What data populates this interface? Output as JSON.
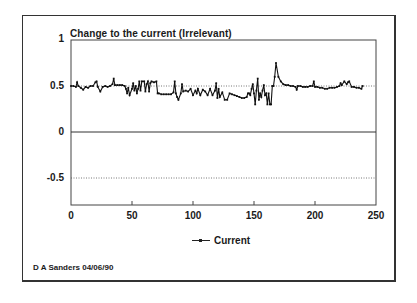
{
  "chart_data": {
    "type": "line",
    "title": "Change to the current (Irrelevant)",
    "xlabel": "",
    "ylabel": "",
    "xlim": [
      0,
      250
    ],
    "ylim": [
      -0.8,
      1
    ],
    "x_ticks": [
      "0",
      "50",
      "100",
      "150",
      "200",
      "250"
    ],
    "y_ticks": [
      "1",
      "0.5",
      "0",
      "-0.5"
    ],
    "reference_lines": [
      {
        "y": 0.5,
        "style": "dotted"
      },
      {
        "y": 0,
        "style": "solid"
      },
      {
        "y": -0.5,
        "style": "dotted"
      }
    ],
    "legend": {
      "position": "bottom",
      "entries": [
        "Current"
      ]
    },
    "grid": false,
    "series": [
      {
        "name": "Current",
        "marker": "small-square",
        "x": [
          0,
          2,
          4,
          5,
          6,
          8,
          10,
          12,
          14,
          16,
          18,
          20,
          21,
          22,
          24,
          26,
          28,
          30,
          32,
          34,
          35,
          36,
          38,
          40,
          42,
          44,
          45,
          46,
          47,
          48,
          50,
          51,
          52,
          53,
          54,
          55,
          56,
          57,
          58,
          60,
          61,
          62,
          63,
          64,
          65,
          66,
          68,
          70,
          71,
          72,
          74,
          76,
          78,
          80,
          82,
          84,
          85,
          86,
          87,
          88,
          90,
          91,
          92,
          94,
          96,
          98,
          100,
          102,
          103,
          104,
          106,
          108,
          110,
          112,
          114,
          116,
          118,
          119,
          120,
          121,
          122,
          124,
          126,
          128,
          130,
          132,
          134,
          136,
          138,
          140,
          142,
          144,
          145,
          146,
          147,
          148,
          149,
          150,
          151,
          152,
          153,
          154,
          155,
          156,
          157,
          158,
          159,
          160,
          161,
          162,
          163,
          164,
          165,
          166,
          167,
          168,
          170,
          172,
          174,
          176,
          178,
          180,
          182,
          184,
          185,
          186,
          188,
          190,
          192,
          194,
          196,
          198,
          199,
          200,
          202,
          204,
          206,
          208,
          210,
          212,
          214,
          216,
          218,
          220,
          221,
          222,
          224,
          226,
          227,
          228,
          230,
          232,
          234,
          236,
          238,
          239
        ],
        "values": [
          0.5,
          0.5,
          0.49,
          0.54,
          0.5,
          0.48,
          0.46,
          0.49,
          0.48,
          0.5,
          0.5,
          0.54,
          0.55,
          0.49,
          0.44,
          0.49,
          0.5,
          0.49,
          0.5,
          0.52,
          0.58,
          0.51,
          0.51,
          0.51,
          0.51,
          0.5,
          0.47,
          0.42,
          0.48,
          0.4,
          0.47,
          0.53,
          0.45,
          0.5,
          0.42,
          0.47,
          0.55,
          0.45,
          0.55,
          0.55,
          0.44,
          0.52,
          0.55,
          0.44,
          0.53,
          0.55,
          0.54,
          0.55,
          0.42,
          0.42,
          0.41,
          0.41,
          0.41,
          0.41,
          0.41,
          0.43,
          0.55,
          0.42,
          0.38,
          0.35,
          0.42,
          0.52,
          0.44,
          0.45,
          0.44,
          0.47,
          0.4,
          0.45,
          0.42,
          0.47,
          0.4,
          0.46,
          0.44,
          0.4,
          0.47,
          0.4,
          0.45,
          0.53,
          0.37,
          0.47,
          0.38,
          0.43,
          0.35,
          0.35,
          0.42,
          0.41,
          0.4,
          0.39,
          0.38,
          0.37,
          0.37,
          0.38,
          0.42,
          0.42,
          0.4,
          0.47,
          0.52,
          0.42,
          0.3,
          0.45,
          0.58,
          0.35,
          0.42,
          0.38,
          0.45,
          0.51,
          0.4,
          0.42,
          0.3,
          0.42,
          0.3,
          0.3,
          0.5,
          0.5,
          0.6,
          0.75,
          0.6,
          0.55,
          0.52,
          0.51,
          0.51,
          0.5,
          0.5,
          0.49,
          0.46,
          0.5,
          0.5,
          0.49,
          0.49,
          0.49,
          0.5,
          0.5,
          0.55,
          0.49,
          0.49,
          0.48,
          0.48,
          0.47,
          0.47,
          0.48,
          0.48,
          0.48,
          0.49,
          0.5,
          0.53,
          0.51,
          0.55,
          0.52,
          0.54,
          0.55,
          0.49,
          0.49,
          0.48,
          0.48,
          0.47,
          0.5
        ]
      }
    ]
  },
  "header": {
    "title": "Change to the current (Irrelevant)"
  },
  "axes": {
    "y_labels": [
      "1",
      "0.5",
      "0",
      "-0.5"
    ],
    "x_labels": [
      "0",
      "50",
      "100",
      "150",
      "200",
      "250"
    ]
  },
  "legend": {
    "label": "Current"
  },
  "footer": {
    "credit": "D A Sanders 04/06/90"
  }
}
